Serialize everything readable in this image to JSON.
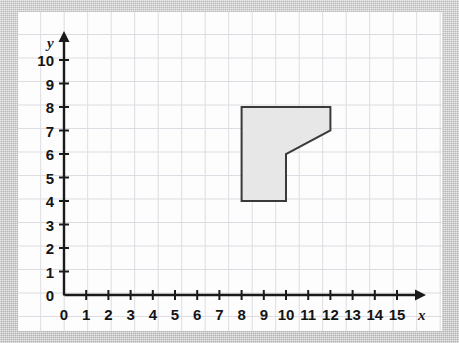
{
  "figure": {
    "kind": "coordinate-plane-polygon",
    "background_color": "#c9c9c9",
    "panel_color": "#fdfdfd",
    "grid_color": "#dcdce2",
    "axis_color": "#1a1a1a",
    "shape_fill": "#e7e7e7",
    "shape_stroke": "#3a3a3a"
  },
  "axes": {
    "x_label": "x",
    "y_label": "y",
    "x_ticks": [
      "0",
      "1",
      "2",
      "3",
      "4",
      "5",
      "6",
      "7",
      "8",
      "9",
      "10",
      "11",
      "12",
      "13",
      "14",
      "15"
    ],
    "y_ticks": [
      "0",
      "1",
      "2",
      "3",
      "4",
      "5",
      "6",
      "7",
      "8",
      "9",
      "10"
    ],
    "x_min": 0,
    "x_max": 15,
    "y_min": 0,
    "y_max": 10,
    "x_arrow": "arrow-right",
    "y_arrow": "arrow-up",
    "origin_label": "0"
  },
  "chart_data": {
    "type": "scatter",
    "title": "",
    "xlabel": "x",
    "ylabel": "y",
    "xlim": [
      0,
      15
    ],
    "ylim": [
      0,
      10
    ],
    "grid": true,
    "legend": "none",
    "series": [
      {
        "name": "shaded-polygon",
        "kind": "polygon",
        "fill": "#e7e7e7",
        "stroke": "#3a3a3a",
        "vertices": [
          [
            8,
            8
          ],
          [
            12,
            8
          ],
          [
            12,
            7
          ],
          [
            10,
            6
          ],
          [
            10,
            4
          ],
          [
            8,
            4
          ]
        ]
      }
    ]
  }
}
